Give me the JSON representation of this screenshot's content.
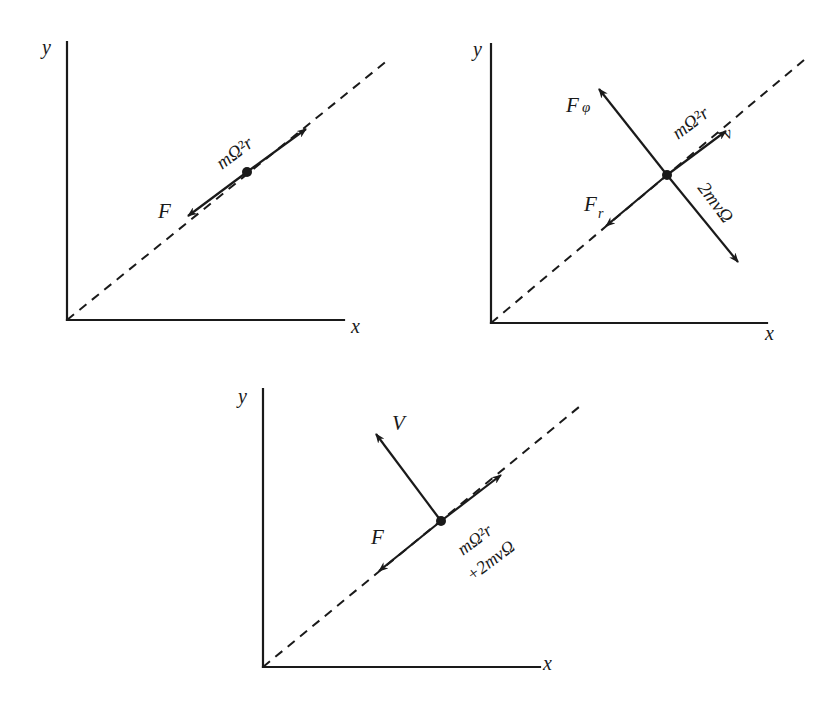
{
  "figure": {
    "background": "#ffffff",
    "ink": "#1a1a1a",
    "panels": [
      {
        "id": "panel-1",
        "axis_labels": {
          "x": "x",
          "y": "y"
        },
        "origin": [
          67,
          320
        ],
        "y_axis_top": [
          67,
          42
        ],
        "x_axis_end": [
          344,
          320
        ],
        "radial_line_end": [
          388,
          60
        ],
        "particle": [
          247,
          172
        ],
        "vectors": [
          {
            "name": "centrifugal",
            "from": [
              247,
              172
            ],
            "to": [
              306,
              129
            ]
          },
          {
            "name": "force-F",
            "from": [
              247,
              172
            ],
            "to": [
              188,
              216
            ]
          }
        ],
        "labels": [
          {
            "key": "y_label",
            "text": "y",
            "x": 42,
            "y": 54,
            "size": 20,
            "rotate": 0
          },
          {
            "key": "x_label",
            "text": "x",
            "x": 351,
            "y": 333,
            "size": 20,
            "rotate": 0
          },
          {
            "key": "F_label",
            "text": "F",
            "x": 158,
            "y": 218,
            "size": 21,
            "rotate": 0
          },
          {
            "key": "centrifugal_label",
            "text": "mΩ²r",
            "x": 222,
            "y": 170,
            "size": 19,
            "rotate": -37
          }
        ]
      },
      {
        "id": "panel-2",
        "axis_labels": {
          "x": "x",
          "y": "y"
        },
        "origin": [
          491,
          323
        ],
        "y_axis_top": [
          491,
          44
        ],
        "x_axis_end": [
          767,
          323
        ],
        "radial_line_end": [
          804,
          60
        ],
        "particle": [
          667,
          175
        ],
        "vectors": [
          {
            "name": "centrifugal",
            "from": [
              667,
              175
            ],
            "to": [
              726,
              131
            ]
          },
          {
            "name": "force-Fr",
            "from": [
              667,
              175
            ],
            "to": [
              606,
              226
            ]
          },
          {
            "name": "force-Fphi",
            "from": [
              667,
              175
            ],
            "to": [
              599,
              89
            ]
          },
          {
            "name": "coriolis",
            "from": [
              667,
              175
            ],
            "to": [
              738,
              262
            ]
          }
        ],
        "labels": [
          {
            "key": "y_label",
            "text": "y",
            "x": 473,
            "y": 56,
            "size": 20,
            "rotate": 0
          },
          {
            "key": "x_label",
            "text": "x",
            "x": 765,
            "y": 340,
            "size": 20,
            "rotate": 0
          },
          {
            "key": "Fphi_label",
            "text": "F",
            "x": 566,
            "y": 112,
            "size": 21,
            "rotate": 0
          },
          {
            "key": "Fphi_sub",
            "text": "φ",
            "x": 582,
            "y": 112,
            "size": 15,
            "rotate": 0
          },
          {
            "key": "Fr_label",
            "text": "F",
            "x": 584,
            "y": 211,
            "size": 21,
            "rotate": 0
          },
          {
            "key": "Fr_sub",
            "text": "r",
            "x": 598,
            "y": 218,
            "size": 14,
            "rotate": 0
          },
          {
            "key": "centrifugal_label",
            "text": "mΩ²r",
            "x": 678,
            "y": 140,
            "size": 19,
            "rotate": -37
          },
          {
            "key": "v_label",
            "text": "v",
            "x": 727,
            "y": 140,
            "size": 17,
            "rotate": -30
          },
          {
            "key": "coriolis_label",
            "text": "2mvΩ",
            "x": 697,
            "y": 188,
            "size": 19,
            "rotate": 53
          }
        ]
      },
      {
        "id": "panel-3",
        "axis_labels": {
          "x": "x",
          "y": "y"
        },
        "origin": [
          263,
          667
        ],
        "y_axis_top": [
          263,
          389
        ],
        "x_axis_end": [
          540,
          667
        ],
        "radial_line_end": [
          579,
          407
        ],
        "particle": [
          441,
          521
        ],
        "vectors": [
          {
            "name": "centrifugal-plus-coriolis",
            "from": [
              441,
              521
            ],
            "to": [
              501,
              475
            ]
          },
          {
            "name": "force-F",
            "from": [
              441,
              521
            ],
            "to": [
              379,
              571
            ]
          },
          {
            "name": "velocity-V",
            "from": [
              441,
              521
            ],
            "to": [
              376,
              434
            ]
          }
        ],
        "labels": [
          {
            "key": "y_label",
            "text": "y",
            "x": 238,
            "y": 403,
            "size": 20,
            "rotate": 0
          },
          {
            "key": "x_label",
            "text": "x",
            "x": 543,
            "y": 670,
            "size": 20,
            "rotate": 0
          },
          {
            "key": "V_label",
            "text": "V",
            "x": 392,
            "y": 430,
            "size": 21,
            "rotate": 0
          },
          {
            "key": "F_label",
            "text": "F",
            "x": 371,
            "y": 544,
            "size": 21,
            "rotate": 0
          },
          {
            "key": "centrifugal_label",
            "text": "mΩ²r",
            "x": 463,
            "y": 556,
            "size": 18,
            "rotate": -37
          },
          {
            "key": "coriolis_label",
            "text": "+2mvΩ",
            "x": 472,
            "y": 582,
            "size": 18,
            "rotate": -37
          }
        ]
      }
    ]
  }
}
